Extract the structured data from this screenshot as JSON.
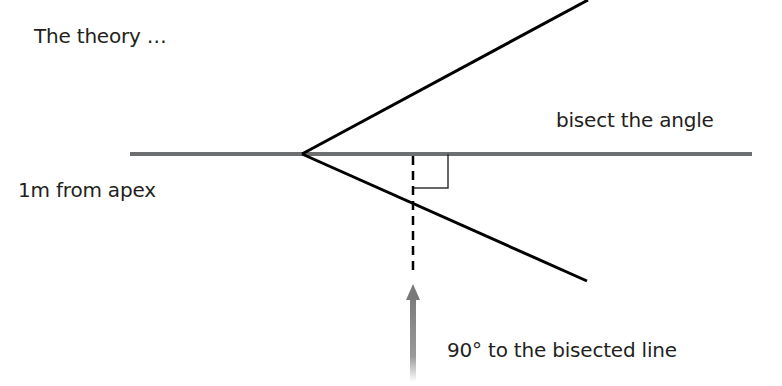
{
  "title": "The theory …",
  "labels": {
    "bisect": "bisect the angle",
    "from_apex": "1m from apex",
    "perpendicular": "90° to the bisected line"
  },
  "colors": {
    "text": "#231f20",
    "bisector_line": "#6d6e70",
    "angle_lines": "#000000",
    "arrow": "#808080"
  }
}
